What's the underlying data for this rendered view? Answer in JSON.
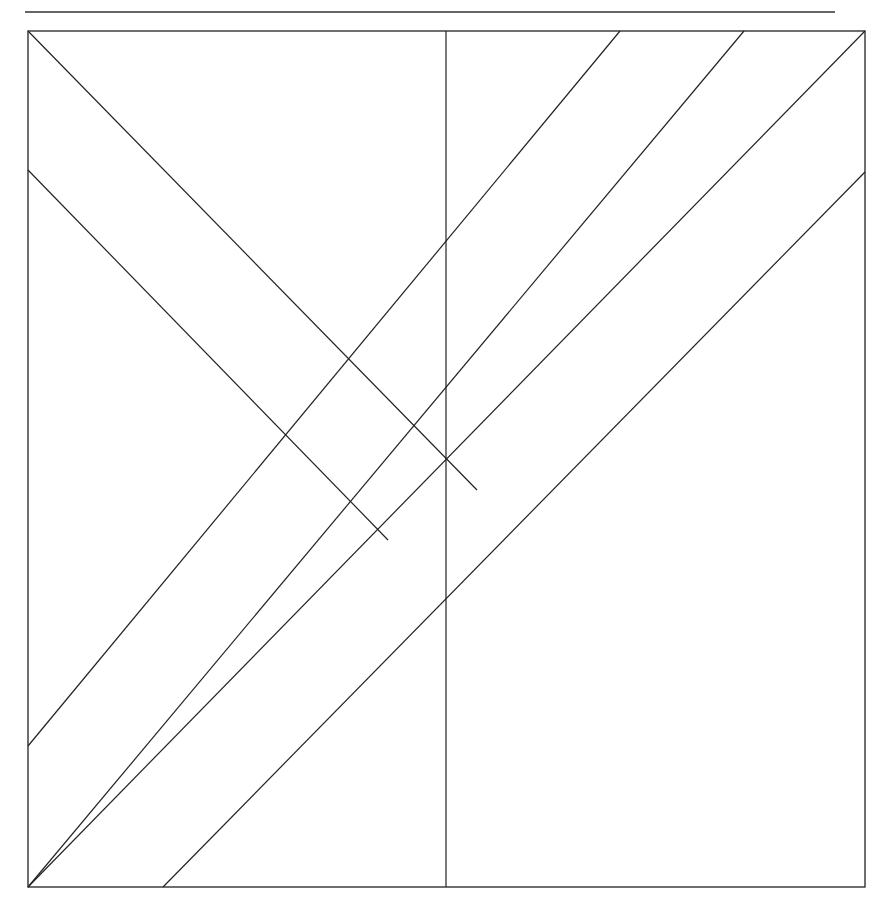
{
  "header": {
    "caption_partial": ""
  },
  "diagram": {
    "stroke_color": "#222222",
    "rule_color": "#333333",
    "top_rule": {
      "x1": 25,
      "y1": 12,
      "x2": 835,
      "y2": 12
    },
    "frame": {
      "x": 28,
      "y": 31,
      "width": 837,
      "height": 856
    },
    "lines": [
      {
        "id": "diag-descending-long",
        "x1": 28,
        "y1": 31,
        "x2": 477,
        "y2": 490
      },
      {
        "id": "diag-descending-short",
        "x1": 28,
        "y1": 170,
        "x2": 388,
        "y2": 540
      },
      {
        "id": "vertical-mid",
        "x1": 446,
        "y1": 31,
        "x2": 446,
        "y2": 887
      },
      {
        "id": "ascending-1",
        "x1": 28,
        "y1": 746,
        "x2": 620,
        "y2": 31
      },
      {
        "id": "ascending-2",
        "x1": 28,
        "y1": 887,
        "x2": 744,
        "y2": 31
      },
      {
        "id": "ascending-3",
        "x1": 28,
        "y1": 887,
        "x2": 865,
        "y2": 31
      },
      {
        "id": "ascending-4",
        "x1": 163,
        "y1": 887,
        "x2": 865,
        "y2": 172
      }
    ]
  }
}
